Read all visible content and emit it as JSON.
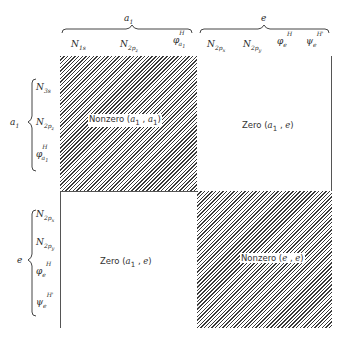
{
  "columns": {
    "groups": [
      {
        "label": "a1",
        "base": "a",
        "sub": "1"
      },
      {
        "label": "e",
        "base": "e",
        "sub": ""
      }
    ],
    "items": [
      {
        "base": "N",
        "sub": "1s",
        "sup": ""
      },
      {
        "base": "N",
        "sub": "2p_z",
        "sup": ""
      },
      {
        "base": "φ",
        "sub": "a1",
        "sup": "H"
      },
      {
        "base": "N",
        "sub": "2p_x",
        "sup": ""
      },
      {
        "base": "N",
        "sub": "2p_y",
        "sup": ""
      },
      {
        "base": "φ",
        "sub": "e",
        "sup": "H"
      },
      {
        "base": "ψ",
        "sub": "e",
        "sup": "H'"
      }
    ]
  },
  "rows": {
    "groups": [
      {
        "label": "a1",
        "base": "a",
        "sub": "1"
      },
      {
        "label": "e",
        "base": "e",
        "sub": ""
      }
    ],
    "items": [
      {
        "base": "N",
        "sub": "1s",
        "sup": ""
      },
      {
        "base": "N",
        "sub": "2p_z",
        "sup": ""
      },
      {
        "base": "φ",
        "sub": "a1",
        "sup": "H"
      },
      {
        "base": "N",
        "sub": "2p_x",
        "sup": ""
      },
      {
        "base": "N",
        "sub": "2p_y",
        "sup": ""
      },
      {
        "base": "φ",
        "sub": "e",
        "sup": "H"
      },
      {
        "base": "ψ",
        "sub": "e",
        "sup": "H'"
      }
    ]
  },
  "blocks": {
    "a1_a1": {
      "text": "Nonzero",
      "args": "(a1 , a1)",
      "arg1": "a",
      "arg1sub": "1",
      "arg2": "a",
      "arg2sub": "1",
      "pattern": "hatched"
    },
    "a1_e": {
      "text": "Zero",
      "arg1": "a",
      "arg1sub": "1",
      "arg2": "e",
      "pattern": "blank"
    },
    "e_a1": {
      "text": "Zero",
      "arg1": "a",
      "arg1sub": "1",
      "arg2": "e",
      "pattern": "blank"
    },
    "e_e": {
      "text": "Nonzero",
      "arg1": "e",
      "arg2": "e",
      "pattern": "hatched"
    }
  },
  "colors": {
    "hatch": "#3a3a3a",
    "background": "#ffffff",
    "text": "#2a2a2a"
  }
}
